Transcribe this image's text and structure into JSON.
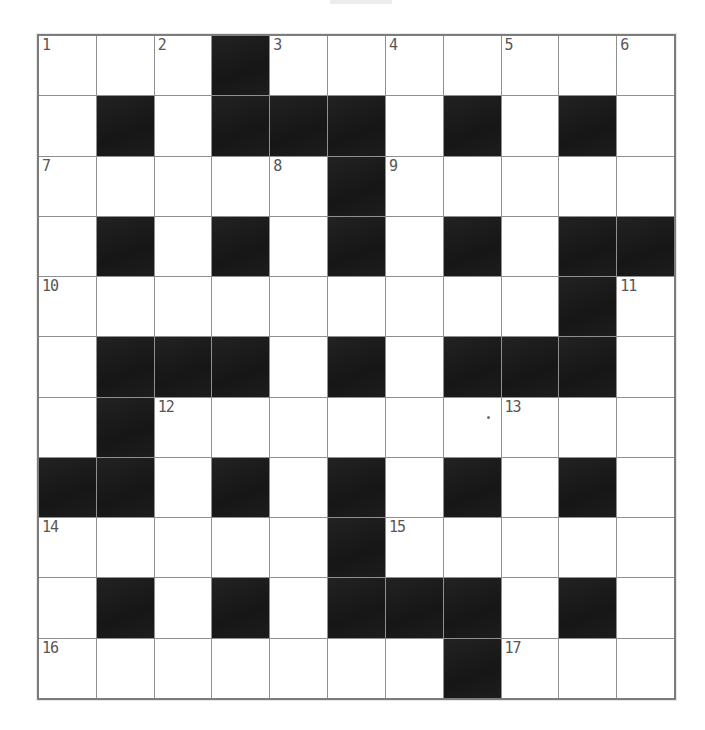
{
  "page": {
    "background_color": "#ffffff",
    "top_artifact": {
      "description": "faint cut-off print mark above grid",
      "color": "#ececee"
    }
  },
  "crossword": {
    "rows": 11,
    "cols": 11,
    "colors": {
      "white_cell": "#ffffff",
      "black_cell": "#1b1b1b",
      "grid_line": "#8f8f8f",
      "outer_border": "#7c7c7c",
      "number_text": "#565656"
    },
    "black_cells": [
      [
        0,
        3
      ],
      [
        1,
        1
      ],
      [
        1,
        3
      ],
      [
        1,
        4
      ],
      [
        1,
        5
      ],
      [
        1,
        7
      ],
      [
        1,
        9
      ],
      [
        2,
        5
      ],
      [
        3,
        1
      ],
      [
        3,
        3
      ],
      [
        3,
        5
      ],
      [
        3,
        7
      ],
      [
        3,
        9
      ],
      [
        3,
        10
      ],
      [
        4,
        9
      ],
      [
        5,
        1
      ],
      [
        5,
        2
      ],
      [
        5,
        3
      ],
      [
        5,
        5
      ],
      [
        5,
        7
      ],
      [
        5,
        8
      ],
      [
        5,
        9
      ],
      [
        6,
        1
      ],
      [
        7,
        0
      ],
      [
        7,
        1
      ],
      [
        7,
        3
      ],
      [
        7,
        5
      ],
      [
        7,
        7
      ],
      [
        7,
        9
      ],
      [
        8,
        5
      ],
      [
        9,
        1
      ],
      [
        9,
        3
      ],
      [
        9,
        5
      ],
      [
        9,
        6
      ],
      [
        9,
        7
      ],
      [
        9,
        9
      ],
      [
        10,
        7
      ]
    ],
    "numbers": [
      {
        "row": 0,
        "col": 0,
        "label": "1"
      },
      {
        "row": 0,
        "col": 2,
        "label": "2"
      },
      {
        "row": 0,
        "col": 4,
        "label": "3"
      },
      {
        "row": 0,
        "col": 6,
        "label": "4"
      },
      {
        "row": 0,
        "col": 8,
        "label": "5"
      },
      {
        "row": 0,
        "col": 10,
        "label": "6"
      },
      {
        "row": 2,
        "col": 0,
        "label": "7"
      },
      {
        "row": 2,
        "col": 4,
        "label": "8"
      },
      {
        "row": 2,
        "col": 6,
        "label": "9"
      },
      {
        "row": 4,
        "col": 0,
        "label": "10"
      },
      {
        "row": 4,
        "col": 10,
        "label": "11"
      },
      {
        "row": 6,
        "col": 2,
        "label": "12"
      },
      {
        "row": 6,
        "col": 8,
        "label": "13"
      },
      {
        "row": 8,
        "col": 0,
        "label": "14"
      },
      {
        "row": 8,
        "col": 6,
        "label": "15"
      },
      {
        "row": 10,
        "col": 0,
        "label": "16"
      },
      {
        "row": 10,
        "col": 8,
        "label": "17"
      }
    ],
    "stray_dot_cell": {
      "row": 6,
      "col": 7
    }
  }
}
